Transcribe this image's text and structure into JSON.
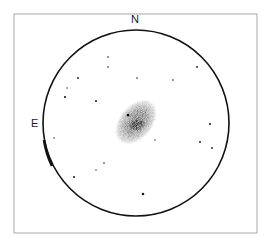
{
  "sketch": {
    "type": "eyepiece-drawing",
    "frame": {
      "x": 14,
      "y": 14,
      "width": 243,
      "height": 219,
      "color": "#a8a8a8"
    },
    "field_of_view": {
      "cx": 136,
      "cy": 123,
      "r": 93,
      "color": "#111111"
    },
    "orientation_labels": {
      "north": "N",
      "east": "E"
    },
    "galaxy": {
      "cx": 136,
      "cy": 122,
      "rx": 17,
      "ry": 26,
      "rotation_deg": 40,
      "halo_color": "#9a9a9a",
      "core_color": "#333333",
      "core": {
        "cx": 137,
        "cy": 125,
        "rx": 9,
        "ry": 6
      },
      "superimposed_star": {
        "x": 128,
        "y": 115
      }
    },
    "stars": [
      {
        "x": 108,
        "y": 57,
        "r": 0.8
      },
      {
        "x": 108,
        "y": 67,
        "r": 0.8
      },
      {
        "x": 78,
        "y": 78,
        "r": 0.9
      },
      {
        "x": 67,
        "y": 88,
        "r": 0.7
      },
      {
        "x": 65,
        "y": 97,
        "r": 1.1
      },
      {
        "x": 96,
        "y": 101,
        "r": 1.0
      },
      {
        "x": 137,
        "y": 78,
        "r": 0.8
      },
      {
        "x": 173,
        "y": 80,
        "r": 0.8
      },
      {
        "x": 197,
        "y": 67,
        "r": 0.9
      },
      {
        "x": 210,
        "y": 124,
        "r": 1.1
      },
      {
        "x": 200,
        "y": 142,
        "r": 1.0
      },
      {
        "x": 212,
        "y": 148,
        "r": 0.9
      },
      {
        "x": 155,
        "y": 140,
        "r": 0.7
      },
      {
        "x": 54,
        "y": 138,
        "r": 0.7
      },
      {
        "x": 104,
        "y": 163,
        "r": 0.8
      },
      {
        "x": 96,
        "y": 170,
        "r": 0.7
      },
      {
        "x": 74,
        "y": 177,
        "r": 1.0
      },
      {
        "x": 143,
        "y": 194,
        "r": 1.3
      }
    ]
  }
}
